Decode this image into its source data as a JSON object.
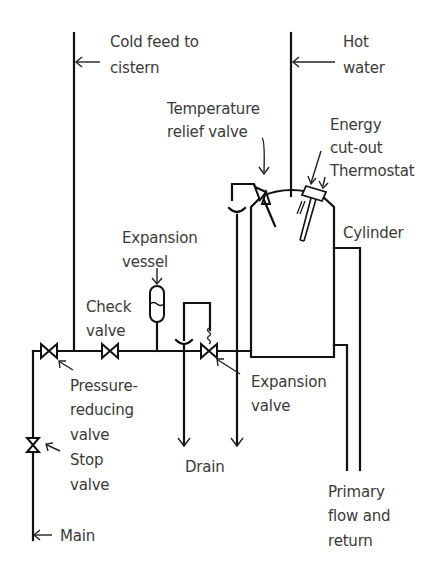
{
  "diagram": {
    "labels": {
      "cold_feed": [
        "Cold feed to",
        "cistern"
      ],
      "hot_water": [
        "Hot",
        "water"
      ],
      "temperature_relief_valve": [
        "Temperature",
        "relief valve"
      ],
      "energy_cutout": [
        "Energy",
        "cut-out",
        "Thermostat"
      ],
      "cylinder": [
        "Cylinder"
      ],
      "expansion_vessel": [
        "Expansion",
        "vessel"
      ],
      "check_valve": [
        "Check",
        "valve"
      ],
      "expansion_valve": [
        "Expansion",
        "valve"
      ],
      "pressure_reducing_valve": [
        "Pressure-",
        "reducing",
        "valve"
      ],
      "stop_valve": [
        "Stop",
        "valve"
      ],
      "drain": [
        "Drain"
      ],
      "primary_flow": [
        "Primary",
        "flow and",
        "return"
      ],
      "main": [
        "Main"
      ]
    },
    "colors": {
      "line": "#111111",
      "text": "#3a3a3a",
      "background": "#ffffff"
    }
  }
}
